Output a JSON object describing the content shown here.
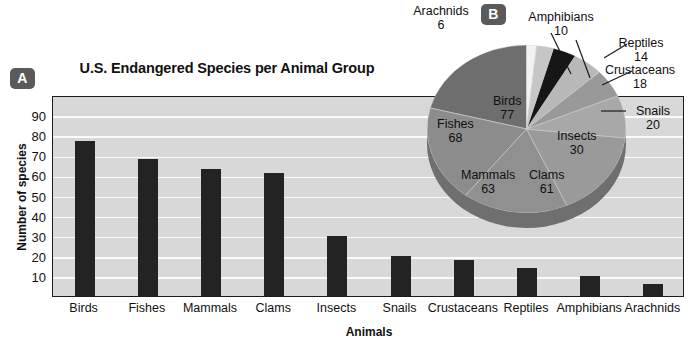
{
  "panels": {
    "a_badge": "A",
    "b_badge": "B"
  },
  "bar_chart": {
    "title": "U.S. Endangered Species per Animal Group",
    "xlabel": "Animals",
    "ylabel": "Number of species"
  },
  "chart_data": [
    {
      "type": "bar",
      "title": "U.S. Endangered Species per Animal Group",
      "xlabel": "Animals",
      "ylabel": "Number of species",
      "categories": [
        "Birds",
        "Fishes",
        "Mammals",
        "Clams",
        "Insects",
        "Snails",
        "Crustaceans",
        "Reptiles",
        "Amphibians",
        "Arachnids"
      ],
      "values": [
        77,
        68,
        63,
        61,
        30,
        20,
        18,
        14,
        10,
        6
      ],
      "ylim": [
        0,
        100
      ],
      "yticks": [
        10,
        20,
        30,
        40,
        50,
        60,
        70,
        80,
        90
      ],
      "grid": true,
      "legend": "none",
      "bar_color": "#232323",
      "plot_background": "#d8d8d8"
    },
    {
      "type": "pie",
      "title": "",
      "labels": [
        "Birds",
        "Fishes",
        "Mammals",
        "Clams",
        "Insects",
        "Snails",
        "Crustaceans",
        "Reptiles",
        "Amphibians",
        "Arachnids"
      ],
      "values": [
        77,
        68,
        63,
        61,
        30,
        20,
        18,
        14,
        10,
        6
      ],
      "total": 367,
      "slice_colors": [
        "#6e6e6e",
        "#8c8c8c",
        "#909090",
        "#9a9a9a",
        "#a8a8a8",
        "#999999",
        "#b8b8b8",
        "#161616",
        "#c6c6c6",
        "#f2f2f2"
      ],
      "legend": "labels-on-slices-and-callouts"
    }
  ],
  "pie_labels": {
    "birds": {
      "name": "Birds",
      "value": "77"
    },
    "fishes": {
      "name": "Fishes",
      "value": "68"
    },
    "mammals": {
      "name": "Mammals",
      "value": "63"
    },
    "clams": {
      "name": "Clams",
      "value": "61"
    },
    "insects": {
      "name": "Insects",
      "value": "30"
    },
    "snails": {
      "name": "Snails",
      "value": "20"
    },
    "crustaceans": {
      "name": "Crustaceans",
      "value": "18"
    },
    "reptiles": {
      "name": "Reptiles",
      "value": "14"
    },
    "amphibians": {
      "name": "Amphibians",
      "value": "10"
    },
    "arachnids": {
      "name": "Arachnids",
      "value": "6"
    }
  },
  "axis": {
    "yticks": [
      "90",
      "80",
      "70",
      "60",
      "50",
      "40",
      "30",
      "20",
      "10"
    ],
    "xticks": [
      "Birds",
      "Fishes",
      "Mammals",
      "Clams",
      "Insects",
      "Snails",
      "Crustaceans",
      "Reptiles",
      "Amphibians",
      "Arachnids"
    ]
  }
}
